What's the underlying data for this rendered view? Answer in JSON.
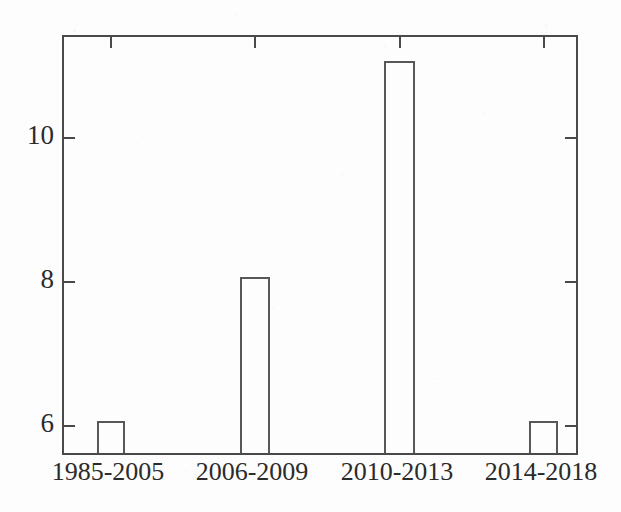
{
  "chart_data": {
    "type": "bar",
    "title": "",
    "subtitle": "",
    "xlabel": "",
    "ylabel": "",
    "categories": [
      "1985-2005",
      "2006-2009",
      "2010-2013",
      "2014-2018"
    ],
    "values": [
      6,
      8,
      11,
      6
    ],
    "series": [
      {
        "name": "count",
        "values": [
          6,
          8,
          11,
          6
        ]
      }
    ],
    "ylim": [
      4.6,
      11.5
    ],
    "yticks": [
      6,
      8,
      10
    ],
    "ytick_labels": [
      "6",
      "8",
      "10"
    ],
    "xtick_labels": [
      "1985-2005",
      "2006-2009",
      "2010-2013",
      "2014-2018"
    ],
    "grid": false,
    "legend": false,
    "legend_position": "none",
    "annotations": [],
    "bar_style": "unfilled-outline",
    "axis_frame": "box-all-four-sides",
    "tick_direction": "inward",
    "colors": {
      "axis": "#4a4a4a",
      "bar_outline": "#585858",
      "bar_fill": "transparent",
      "text": "#2b2b2b",
      "background": "#fdfdfd"
    }
  },
  "geometry": {
    "plot": {
      "left": 62,
      "top": 35,
      "right": 578,
      "bottom": 455
    },
    "y_pixels": {
      "6": 423,
      "8": 279,
      "10": 135
    },
    "bars": [
      {
        "left": 95,
        "right": 123,
        "top": 423
      },
      {
        "left": 238,
        "right": 268,
        "top": 279
      },
      {
        "left": 382,
        "right": 413,
        "top": 64
      },
      {
        "left": 527,
        "right": 556,
        "top": 423
      }
    ],
    "x_tick_centers": [
      108,
      252,
      397,
      541
    ]
  }
}
